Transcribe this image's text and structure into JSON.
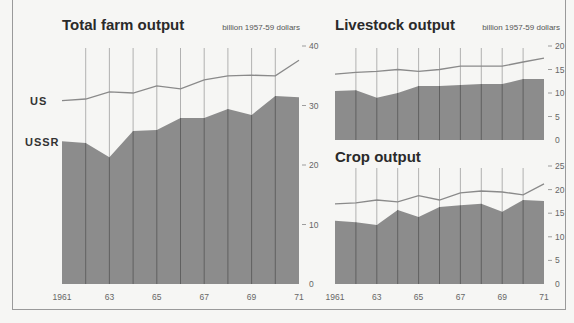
{
  "colors": {
    "background": "#f6f6f4",
    "ussr_fill": "#8c8c8c",
    "us_line": "#8a8a8a",
    "grid_over_fill": "#555555",
    "grid_over_bg": "#a0a0a0",
    "frame": "#9a9a9a"
  },
  "series_labels": {
    "us": "US",
    "ussr": "USSR"
  },
  "chart_data": [
    {
      "id": "total",
      "type": "area",
      "title": "Total farm output",
      "unit_label": "billion 1957-59 dollars",
      "xlabel": "",
      "ylabel": "billion 1957-59 dollars",
      "x": [
        1961,
        1962,
        1963,
        1964,
        1965,
        1966,
        1967,
        1968,
        1969,
        1970,
        1971
      ],
      "x_tick_labels": [
        "1961",
        "63",
        "65",
        "67",
        "69",
        "71"
      ],
      "y_ticks": [
        0,
        10,
        20,
        30,
        40
      ],
      "ylim": [
        0,
        40
      ],
      "series": [
        {
          "name": "US",
          "style": "line",
          "values": [
            30.8,
            31.1,
            32.3,
            32.1,
            33.3,
            32.8,
            34.3,
            35.0,
            35.1,
            35.0,
            37.6
          ]
        },
        {
          "name": "USSR",
          "style": "filled-area",
          "values": [
            24.0,
            23.7,
            21.3,
            25.7,
            25.9,
            27.9,
            27.9,
            29.4,
            28.4,
            31.6,
            31.4
          ]
        }
      ]
    },
    {
      "id": "livestock",
      "type": "area",
      "title": "Livestock output",
      "unit_label": "billion 1957-59 dollars",
      "xlabel": "",
      "ylabel": "billion 1957-59 dollars",
      "x": [
        1961,
        1962,
        1963,
        1964,
        1965,
        1966,
        1967,
        1968,
        1969,
        1970,
        1971
      ],
      "x_tick_labels": [],
      "y_ticks": [
        0,
        5,
        10,
        15,
        20
      ],
      "ylim": [
        0,
        20
      ],
      "series": [
        {
          "name": "US",
          "style": "line",
          "values": [
            14.0,
            14.4,
            14.6,
            15.0,
            14.6,
            15.0,
            15.7,
            15.7,
            15.7,
            16.6,
            17.4
          ]
        },
        {
          "name": "USSR",
          "style": "filled-area",
          "values": [
            10.4,
            10.6,
            9.0,
            10.0,
            11.5,
            11.5,
            11.7,
            11.9,
            11.9,
            13.0,
            13.0
          ]
        }
      ]
    },
    {
      "id": "crop",
      "type": "area",
      "title": "Crop output",
      "unit_label": "",
      "xlabel": "",
      "ylabel": "billion 1957-59 dollars",
      "x": [
        1961,
        1962,
        1963,
        1964,
        1965,
        1966,
        1967,
        1968,
        1969,
        1970,
        1971
      ],
      "x_tick_labels": [
        "1961",
        "63",
        "65",
        "67",
        "69",
        "71"
      ],
      "y_ticks": [
        0,
        5,
        10,
        15,
        20,
        25
      ],
      "ylim": [
        0,
        25
      ],
      "series": [
        {
          "name": "US",
          "style": "line",
          "values": [
            17.0,
            17.2,
            17.8,
            17.4,
            18.7,
            17.8,
            19.3,
            19.7,
            19.5,
            18.9,
            21.2
          ]
        },
        {
          "name": "USSR",
          "style": "filled-area",
          "values": [
            13.4,
            13.1,
            12.5,
            15.7,
            14.2,
            16.3,
            16.7,
            17.0,
            15.3,
            17.8,
            17.6
          ]
        }
      ]
    }
  ]
}
